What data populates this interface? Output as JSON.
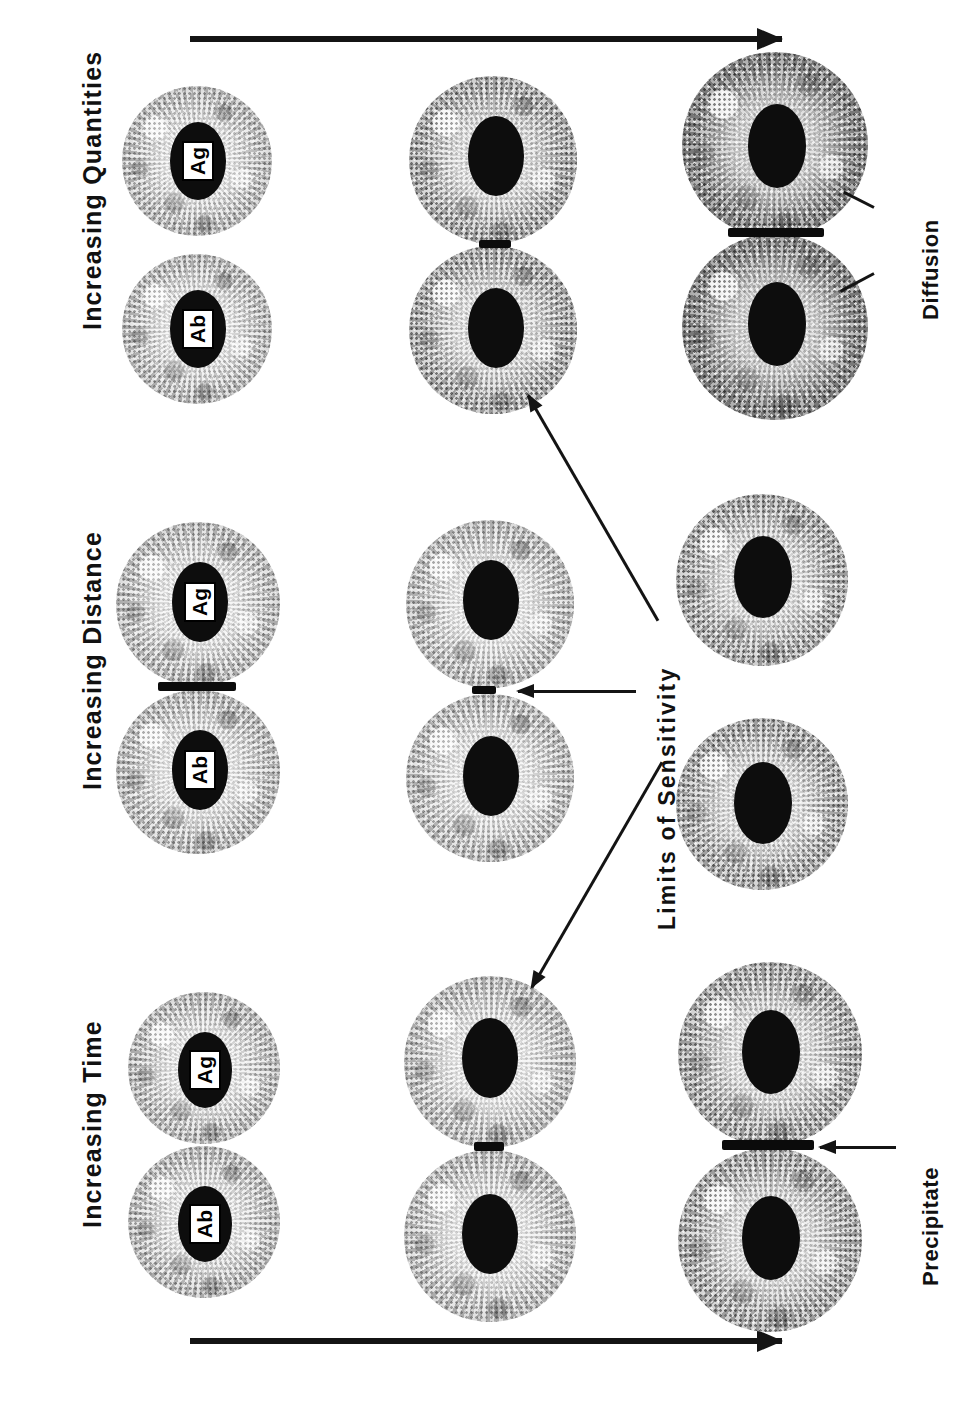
{
  "figure": {
    "background_color": "#ffffff",
    "ink_color": "#111111"
  },
  "progression_arrows": [
    {
      "name": "top-progression-arrow",
      "direction": "right"
    },
    {
      "name": "bottom-progression-arrow",
      "direction": "right"
    }
  ],
  "columns": [
    {
      "id": "increasing-time",
      "title": "Increasing Time",
      "rows": [
        {
          "id": "time-row-1",
          "halo": "small",
          "precipitate": "none"
        },
        {
          "id": "time-row-2",
          "halo": "medium",
          "precipitate": "faint"
        },
        {
          "id": "time-row-3",
          "halo": "large",
          "precipitate": "strong"
        }
      ]
    },
    {
      "id": "increasing-distance",
      "title": "Increasing Distance",
      "rows": [
        {
          "id": "distance-row-1",
          "halo": "medium",
          "precipitate": "strong"
        },
        {
          "id": "distance-row-2",
          "halo": "medium",
          "precipitate": "faint"
        },
        {
          "id": "distance-row-3",
          "halo": "medium",
          "precipitate": "none"
        }
      ]
    },
    {
      "id": "increasing-quantities",
      "title": "Increasing Quantities",
      "rows": [
        {
          "id": "quantities-row-1",
          "halo": "small",
          "precipitate": "none"
        },
        {
          "id": "quantities-row-2",
          "halo": "medium",
          "precipitate": "faint"
        },
        {
          "id": "quantities-row-3",
          "halo": "large",
          "precipitate": "strong"
        }
      ]
    }
  ],
  "well_labels": {
    "antigen": "Ag",
    "antibody": "Ab"
  },
  "annotations": [
    {
      "id": "limits-of-sensitivity",
      "text": "Limits of Sensitivity",
      "arrow_count": 3
    },
    {
      "id": "precipitate",
      "text": "Precipitate",
      "arrow_count": 1
    },
    {
      "id": "diffusion",
      "text": "Diffusion",
      "arrow_count": 2
    }
  ]
}
